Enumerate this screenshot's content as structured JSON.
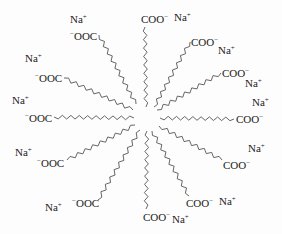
{
  "diagram": {
    "center": {
      "x": 147,
      "y": 118
    },
    "chain_color": "#555555",
    "text_color": "#222222",
    "chains": [
      {
        "id": 0,
        "head": "COO⁻",
        "counterion": "Na⁺",
        "head_pos": [
          141,
          14
        ],
        "ion_pos": [
          174,
          12
        ],
        "from": [
          146,
          107
        ],
        "to": [
          145,
          27
        ]
      },
      {
        "id": 1,
        "head": "COO⁻",
        "counterion": "Na⁺",
        "head_pos": [
          191,
          37
        ],
        "ion_pos": [
          218,
          45
        ],
        "from": [
          154,
          107
        ],
        "to": [
          190,
          42
        ]
      },
      {
        "id": 2,
        "head": "COO⁻",
        "counterion": "Na⁺",
        "head_pos": [
          222,
          68
        ],
        "ion_pos": [
          245,
          78
        ],
        "from": [
          157,
          110
        ],
        "to": [
          221,
          73
        ]
      },
      {
        "id": 3,
        "head": "COO⁻",
        "counterion": "Na⁺",
        "head_pos": [
          236,
          114
        ],
        "ion_pos": [
          252,
          97
        ],
        "from": [
          160,
          118
        ],
        "to": [
          234,
          119
        ]
      },
      {
        "id": 4,
        "head": "COO⁻",
        "counterion": "Na⁺",
        "head_pos": [
          223,
          160
        ],
        "ion_pos": [
          248,
          143
        ],
        "from": [
          159,
          126
        ],
        "to": [
          222,
          160
        ]
      },
      {
        "id": 5,
        "head": "COO⁻",
        "counterion": "Na⁺",
        "head_pos": [
          186,
          198
        ],
        "ion_pos": [
          219,
          196
        ],
        "from": [
          152,
          131
        ],
        "to": [
          189,
          196
        ]
      },
      {
        "id": 6,
        "head": "COO⁻",
        "counterion": "Na⁺",
        "head_pos": [
          143,
          212
        ],
        "ion_pos": [
          172,
          214
        ],
        "from": [
          147,
          131
        ],
        "to": [
          146,
          209
        ]
      },
      {
        "id": 7,
        "head": "⁻OOC",
        "counterion": "Na⁺",
        "head_pos": [
          72,
          198
        ],
        "ion_pos": [
          45,
          202
        ],
        "from": [
          140,
          130
        ],
        "to": [
          98,
          200
        ]
      },
      {
        "id": 8,
        "head": "⁻OOC",
        "counterion": "Na⁺",
        "head_pos": [
          37,
          158
        ],
        "ion_pos": [
          15,
          147
        ],
        "from": [
          135,
          125
        ],
        "to": [
          67,
          160
        ]
      },
      {
        "id": 9,
        "head": "⁻OOC",
        "counterion": "Na⁺",
        "head_pos": [
          25,
          113
        ],
        "ion_pos": [
          12,
          95
        ],
        "from": [
          134,
          118
        ],
        "to": [
          54,
          117
        ]
      },
      {
        "id": 10,
        "head": "⁻OOC",
        "counterion": "Na⁺",
        "head_pos": [
          35,
          73
        ],
        "ion_pos": [
          25,
          53
        ],
        "from": [
          133,
          110
        ],
        "to": [
          64,
          78
        ]
      },
      {
        "id": 11,
        "head": "⁻OOC",
        "counterion": "Na⁺",
        "head_pos": [
          70,
          31
        ],
        "ion_pos": [
          70,
          14
        ],
        "from": [
          136,
          104
        ],
        "to": [
          99,
          35
        ]
      }
    ]
  }
}
